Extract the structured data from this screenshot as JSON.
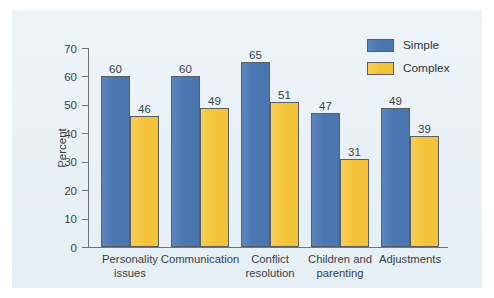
{
  "chart_data": {
    "type": "bar",
    "title": "",
    "subtitle": "",
    "xlabel": "",
    "ylabel": "Percent",
    "ylim": [
      0,
      70
    ],
    "yticks": [
      0,
      10,
      20,
      30,
      40,
      50,
      60,
      70
    ],
    "ytick_labels": [
      "0",
      "10",
      "20",
      "30",
      "40",
      "50",
      "60",
      "70"
    ],
    "grid": false,
    "legend_position": "top-right",
    "categories": [
      "Personality\nissues",
      "Communication",
      "Conflict\nresolution",
      "Children and\nparenting",
      "Adjustments"
    ],
    "series": [
      {
        "name": "Simple",
        "color": "#4c78b2",
        "values": [
          60,
          60,
          65,
          47,
          49
        ],
        "value_labels": [
          "60",
          "60",
          "65",
          "47",
          "49"
        ]
      },
      {
        "name": "Complex",
        "color": "#f4c53c",
        "values": [
          46,
          49,
          51,
          31,
          39
        ],
        "value_labels": [
          "46",
          "49",
          "51",
          "31",
          "39"
        ]
      }
    ]
  },
  "legend": {
    "items": [
      {
        "label": "Simple",
        "swatch": "simple"
      },
      {
        "label": "Complex",
        "swatch": "complex"
      }
    ]
  },
  "colors": {
    "panel_background": "#eaf2f8",
    "page_background": "#ffffff",
    "axis": "#6d7378",
    "text": "#3b3f43",
    "series_simple": "#4c78b2",
    "series_complex": "#f4c53c"
  }
}
